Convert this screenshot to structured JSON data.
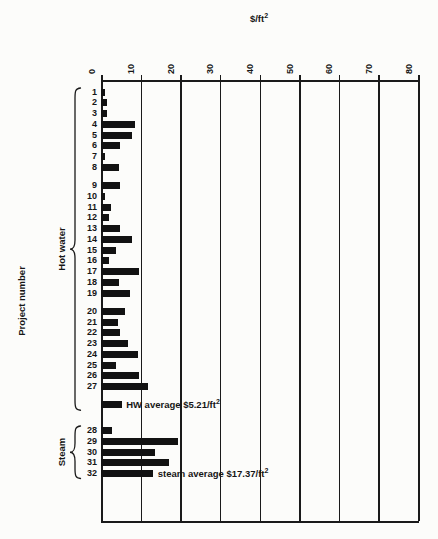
{
  "title": {
    "text": "$/ft",
    "sup": "2"
  },
  "y_axis_label": "Project number",
  "ink_color": "#161616",
  "background_color": "#fcfcfa",
  "chart_data": {
    "type": "bar",
    "orientation": "horizontal",
    "title": "$/ft2",
    "xlabel": "$/ft2",
    "ylabel": "Project number",
    "xlim": [
      0,
      80
    ],
    "x_ticks": [
      0,
      10,
      20,
      30,
      40,
      50,
      60,
      70,
      80
    ],
    "grid": "vertical gridline at every x tick, full plot height, framed top and bottom",
    "bar_color": "#121212",
    "units": "$/ft2",
    "groups": [
      {
        "label": "Hot water",
        "average": {
          "value": 5.21,
          "annotation_text": "HW average $5.21/ft",
          "annotation_sup": "2",
          "name": "hw-average"
        },
        "subgroups": [
          [
            {
              "project": "1",
              "value": 1.1
            },
            {
              "project": "2",
              "value": 1.5
            },
            {
              "project": "3",
              "value": 1.4
            },
            {
              "project": "4",
              "value": 8.5
            },
            {
              "project": "5",
              "value": 7.9
            },
            {
              "project": "6",
              "value": 4.9
            },
            {
              "project": "7",
              "value": 1.0
            },
            {
              "project": "8",
              "value": 4.5
            }
          ],
          [
            {
              "project": "9",
              "value": 4.7
            },
            {
              "project": "10",
              "value": 1.1
            },
            {
              "project": "11",
              "value": 2.4
            },
            {
              "project": "12",
              "value": 2.1
            },
            {
              "project": "13",
              "value": 4.7
            },
            {
              "project": "14",
              "value": 7.9
            },
            {
              "project": "15",
              "value": 3.8
            },
            {
              "project": "16",
              "value": 2.0
            },
            {
              "project": "17",
              "value": 9.7
            },
            {
              "project": "18",
              "value": 4.5
            },
            {
              "project": "19",
              "value": 7.4
            }
          ],
          [
            {
              "project": "20",
              "value": 6.0
            },
            {
              "project": "21",
              "value": 4.3
            },
            {
              "project": "22",
              "value": 4.7
            },
            {
              "project": "23",
              "value": 6.9
            },
            {
              "project": "24",
              "value": 9.3
            },
            {
              "project": "25",
              "value": 3.7
            },
            {
              "project": "26",
              "value": 9.7
            },
            {
              "project": "27",
              "value": 11.9
            }
          ]
        ]
      },
      {
        "label": "Steam",
        "average": null,
        "stated_average_value": 17.37,
        "subgroups": [
          [
            {
              "project": "28",
              "value": 2.8
            },
            {
              "project": "29",
              "value": 19.5
            },
            {
              "project": "30",
              "value": 13.6
            },
            {
              "project": "31",
              "value": 17.1
            },
            {
              "project": "32",
              "value": 13.2,
              "annotation_text": "steam average $17.37/ft",
              "annotation_sup": "2"
            }
          ]
        ]
      }
    ]
  }
}
